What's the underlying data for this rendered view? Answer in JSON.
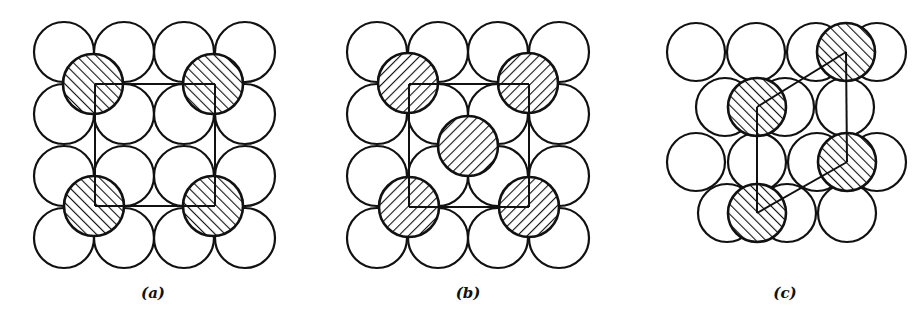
{
  "figure": {
    "panels": [
      {
        "id": "a",
        "label": "(a)",
        "label_pos": [
          153,
          286
        ],
        "radius": 30,
        "hatch": "hatch-a",
        "plain_circles": [
          [
            64,
            52
          ],
          [
            124,
            52
          ],
          [
            184,
            52
          ],
          [
            245,
            52
          ],
          [
            64,
            114
          ],
          [
            124,
            114
          ],
          [
            184,
            114
          ],
          [
            245,
            114
          ],
          [
            64,
            176
          ],
          [
            124,
            176
          ],
          [
            184,
            176
          ],
          [
            245,
            176
          ],
          [
            64,
            238
          ],
          [
            124,
            238
          ],
          [
            184,
            238
          ],
          [
            245,
            238
          ]
        ],
        "shaded_circles": [
          [
            93,
            84
          ],
          [
            213,
            84
          ],
          [
            94,
            206
          ],
          [
            213,
            206
          ]
        ],
        "lines": [
          [
            95,
            84,
            215,
            84
          ],
          [
            215,
            84,
            215,
            206
          ],
          [
            215,
            206,
            95,
            206
          ],
          [
            95,
            206,
            95,
            84
          ]
        ]
      },
      {
        "id": "b",
        "label": "(b)",
        "label_pos": [
          468,
          286
        ],
        "radius": 30,
        "hatch": "hatch-b",
        "plain_circles": [
          [
            377,
            52
          ],
          [
            438,
            52
          ],
          [
            498,
            52
          ],
          [
            559,
            52
          ],
          [
            377,
            114
          ],
          [
            438,
            114
          ],
          [
            498,
            114
          ],
          [
            559,
            114
          ],
          [
            377,
            176
          ],
          [
            438,
            176
          ],
          [
            498,
            176
          ],
          [
            559,
            176
          ],
          [
            377,
            238
          ],
          [
            438,
            238
          ],
          [
            498,
            238
          ],
          [
            559,
            238
          ]
        ],
        "shaded_circles": [
          [
            408,
            83
          ],
          [
            528,
            83
          ],
          [
            468,
            146
          ],
          [
            409,
            207
          ],
          [
            529,
            207
          ]
        ],
        "lines": [
          [
            409,
            84,
            529,
            84
          ],
          [
            529,
            84,
            529,
            207
          ],
          [
            529,
            207,
            409,
            207
          ],
          [
            409,
            207,
            409,
            84
          ]
        ]
      },
      {
        "id": "c",
        "label": "(c)",
        "label_pos": [
          785,
          286
        ],
        "radius": 29,
        "hatch": "hatch-a",
        "plain_circles": [
          [
            696,
            52
          ],
          [
            756,
            52
          ],
          [
            816,
            52
          ],
          [
            877,
            52
          ],
          [
            725,
            107
          ],
          [
            785,
            107
          ],
          [
            845,
            107
          ],
          [
            696,
            162
          ],
          [
            757,
            162
          ],
          [
            817,
            162
          ],
          [
            877,
            162
          ],
          [
            727,
            213
          ],
          [
            787,
            213
          ],
          [
            847,
            213
          ]
        ],
        "shaded_circles": [
          [
            846,
            52
          ],
          [
            757,
            107
          ],
          [
            847,
            162
          ],
          [
            757,
            213
          ]
        ],
        "lines": [
          [
            757,
            107,
            757,
            213
          ],
          [
            846,
            52,
            847,
            162
          ],
          [
            757,
            107,
            846,
            52
          ],
          [
            757,
            213,
            847,
            162
          ]
        ]
      }
    ]
  }
}
